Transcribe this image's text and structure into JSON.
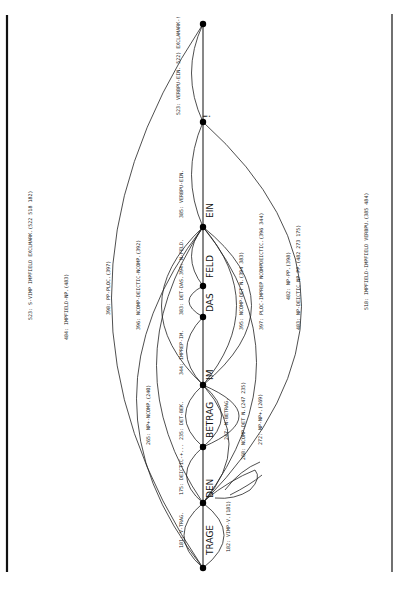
{
  "diagram": {
    "type": "chart-parser-graph",
    "orientation": "rotated-90",
    "words": [
      "TRAGE",
      "DEN",
      "BETRAG",
      "IM",
      "DAS",
      "FELD",
      "EIN",
      "!"
    ],
    "nodes": [
      {
        "id": 0,
        "y": 568
      },
      {
        "id": 1,
        "y": 503
      },
      {
        "id": 2,
        "y": 447
      },
      {
        "id": 3,
        "y": 385
      },
      {
        "id": 4,
        "y": 317
      },
      {
        "id": 5,
        "y": 286
      },
      {
        "id": 6,
        "y": 227
      },
      {
        "id": 7,
        "y": 122
      },
      {
        "id": 8,
        "y": 24
      }
    ],
    "edge_labels": {
      "e181": "181: V-TRAG.",
      "e182": "182: VIMP-V.(181)",
      "e175": "175: DEICTIC-+...",
      "e235": "235: DET-BEK.",
      "e247": "247: N-BETRAG.",
      "e265": "265: NP+-NCOMP.(240)",
      "e268": "268: NCOMP-DET N.(247 235)",
      "e272": "272: NP-NP+.(269)",
      "e344": "344: IMPREP-IM.",
      "e383": "383: DET-DAS.",
      "e394": "394: N-FELD.",
      "e396": "396: NCOMP-DEICTIC-NCOMP.(392)",
      "e398": "398: PP-PLOC.(397)",
      "e395": "395: NCOMP-DET N.(394 383)",
      "e397": "397: PLOC-IMPREP NCOMPDEICTIC.(396 344)",
      "e482": "482: NP-PP.(398)",
      "e483": "483: NP-DEICTIC NP PP.(482 273 175)",
      "e484": "484: IMPFIELD-NP.(483)",
      "e385": "385: VERBPU-EIN.",
      "e523": "523: VERBPU-EIN. 522) EXCLAMARK-!",
      "e522": "523: S-VIMP IMPFIELD EXCLMARK.(522 518 182)",
      "e518": "518: IMPFIELD-IMPFIELD VERBPU.(385 484)"
    }
  }
}
